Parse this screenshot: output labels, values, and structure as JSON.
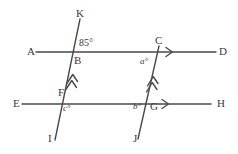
{
  "figure": {
    "stroke_color": "#4a4a4a",
    "text_color": "#3a3a3a",
    "background_color": "#ffffff",
    "width": 238,
    "height": 154
  },
  "points": {
    "A": {
      "label": "A",
      "x": 27,
      "y": 46
    },
    "D": {
      "label": "D",
      "x": 219,
      "y": 46
    },
    "E": {
      "label": "E",
      "x": 13,
      "y": 98
    },
    "H": {
      "label": "H",
      "x": 217,
      "y": 98
    },
    "K": {
      "label": "K",
      "x": 76,
      "y": 8
    },
    "I": {
      "label": "I",
      "x": 48,
      "y": 133
    },
    "C": {
      "label": "C",
      "x": 155,
      "y": 35
    },
    "J": {
      "label": "J",
      "x": 133,
      "y": 133
    },
    "B": {
      "label": "B",
      "x": 74,
      "y": 55
    },
    "F": {
      "label": "F",
      "x": 58,
      "y": 87
    },
    "G": {
      "label": "G",
      "x": 150,
      "y": 101
    }
  },
  "angles": {
    "at_B": {
      "value": "85",
      "symbol": "°",
      "text": "85°",
      "x": 79,
      "y": 38
    },
    "at_C": {
      "variable": "a",
      "symbol": "°",
      "text": "a°",
      "x": 140,
      "y": 57
    },
    "at_F": {
      "variable": "c",
      "symbol": "°",
      "text": "c°",
      "x": 63,
      "y": 104
    },
    "at_G": {
      "variable": "b",
      "symbol": "°",
      "text": "b°",
      "x": 133,
      "y": 102
    }
  },
  "lines": [
    {
      "name": "line-AD",
      "from": "A",
      "to": "D",
      "x1": 36,
      "y1": 52,
      "x2": 216,
      "y2": 52,
      "marker": "single-chevron",
      "marker_x": 170,
      "marker_y": 52
    },
    {
      "name": "line-EH",
      "from": "E",
      "to": "H",
      "x1": 22,
      "y1": 104,
      "x2": 211,
      "y2": 104,
      "marker": "single-chevron",
      "marker_x": 166,
      "marker_y": 104
    },
    {
      "name": "line-KI",
      "from": "K",
      "to": "I",
      "x1": 80,
      "y1": 19,
      "x2": 55,
      "y2": 140,
      "marker": "double-chevron",
      "marker_x": 72,
      "marker_y": 76
    },
    {
      "name": "line-CJ",
      "from": "C",
      "to": "J",
      "x1": 159,
      "y1": 46,
      "x2": 138,
      "y2": 139,
      "marker": "double-chevron",
      "marker_x": 152,
      "marker_y": 78
    }
  ]
}
